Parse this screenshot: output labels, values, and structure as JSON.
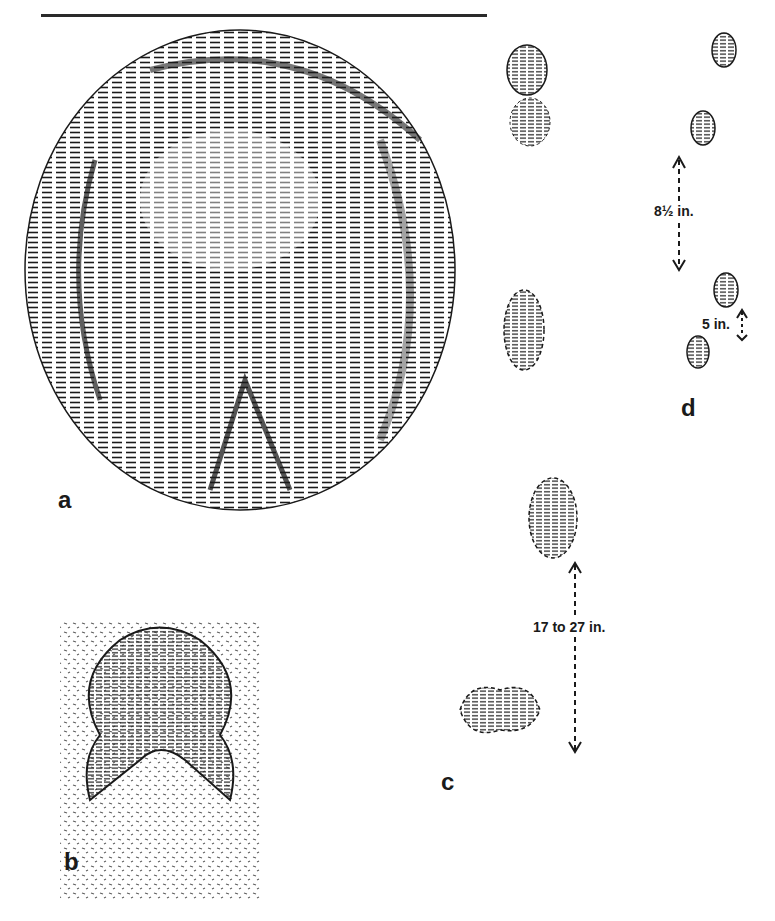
{
  "figure": {
    "panels": [
      {
        "id": "a",
        "label": "a",
        "description": "large hoof print, hatched oval"
      },
      {
        "id": "b",
        "label": "b",
        "description": "small hoof print, dotted outline"
      },
      {
        "id": "c",
        "label": "c",
        "description": "track pattern with measurement"
      },
      {
        "id": "d",
        "label": "d",
        "description": "trail pattern with measurements"
      }
    ],
    "measurements": {
      "c_stride": "17 to 27 in.",
      "d_stride": "8½ in.",
      "d_straddle": "5 in."
    }
  },
  "colors": {
    "ink": "#1a1a1a",
    "paper": "#ffffff"
  }
}
